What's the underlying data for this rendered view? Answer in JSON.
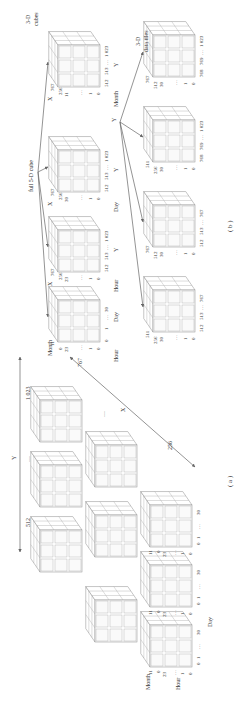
{
  "figure": {
    "orientation": "rotated-90-ccw",
    "panel_a": {
      "caption": "( a )",
      "y_axis": {
        "label": "Y",
        "start": "512",
        "middle": "…",
        "end": "1 023"
      },
      "x_axis": {
        "label": "X",
        "start": "256",
        "middle": "…",
        "end": "767"
      },
      "cube_labels": {
        "month": "Month",
        "hour": "Hour",
        "day": "Day",
        "month_max": "11",
        "month_min": "0",
        "hour_max": "23",
        "hour_dots": "…",
        "hour_one": "1",
        "hour_zero": "0",
        "day_zero": "0",
        "day_one": "1",
        "day_dots": "…",
        "day_max": "30"
      },
      "grid_rows": 3,
      "grid_cols": 3
    },
    "panel_b": {
      "caption": "( b )",
      "root_label": "full 5-D cube",
      "top_row_label": "3-D\ncubes",
      "bottom_row_label": "3-D\ndata tiles",
      "top_row": [
        {
          "id": "month-hour-day",
          "vert_axis": "Hour",
          "horiz_axis": "Day",
          "depth_axis": "Month",
          "v_ticks": [
            "23",
            "…",
            "1",
            "0"
          ],
          "h_ticks": [
            "0",
            "1",
            "…",
            "30"
          ],
          "d_ticks": [
            "0",
            "11"
          ]
        },
        {
          "id": "hour-x-y",
          "vert_axis": "Hour",
          "horiz_axis": "Y",
          "depth_axis": "X",
          "v_ticks": [
            "23",
            "…",
            "1",
            "0"
          ],
          "h_ticks": [
            "512",
            "513",
            "…",
            "1 023"
          ],
          "d_ticks": [
            "256",
            "767"
          ]
        },
        {
          "id": "day-x-y",
          "vert_axis": "Day",
          "horiz_axis": "Y",
          "depth_axis": "X",
          "v_ticks": [
            "30",
            "…",
            "1",
            "0"
          ],
          "h_ticks": [
            "512",
            "513",
            "…",
            "1 023"
          ],
          "d_ticks": [
            "256",
            "767"
          ]
        },
        {
          "id": "month-x-y",
          "vert_axis": "Month",
          "horiz_axis": "Y",
          "depth_axis": "X",
          "v_ticks": [
            "11",
            "…",
            "1",
            "0"
          ],
          "h_ticks": [
            "512",
            "513",
            "…",
            "1 023"
          ],
          "d_ticks": [
            "256",
            "767"
          ]
        }
      ],
      "split_axis_label": "Y",
      "bottom_row": [
        {
          "id": "tile-1",
          "v_ticks": [
            "30",
            "…",
            "1",
            "0"
          ],
          "h_ticks": [
            "512",
            "513",
            "…",
            "767"
          ],
          "d_ticks": [
            "256",
            "511"
          ]
        },
        {
          "id": "tile-2",
          "v_ticks": [
            "30",
            "…",
            "1",
            "0"
          ],
          "h_ticks": [
            "512",
            "513",
            "…",
            "767"
          ],
          "d_ticks": [
            "512",
            "767"
          ]
        },
        {
          "id": "tile-3",
          "v_ticks": [
            "30",
            "…",
            "1",
            "0"
          ],
          "h_ticks": [
            "768",
            "769",
            "…",
            "1 023"
          ],
          "d_ticks": [
            "256",
            "511"
          ]
        },
        {
          "id": "tile-4",
          "v_ticks": [
            "30",
            "…",
            "1",
            "0"
          ],
          "h_ticks": [
            "768",
            "769",
            "…",
            "1 023"
          ],
          "d_ticks": [
            "512",
            "767"
          ]
        }
      ]
    },
    "colors": {
      "line": "#666666",
      "cube_stroke": "#8c8c8c",
      "text": "#333333",
      "background": "#ffffff"
    }
  }
}
